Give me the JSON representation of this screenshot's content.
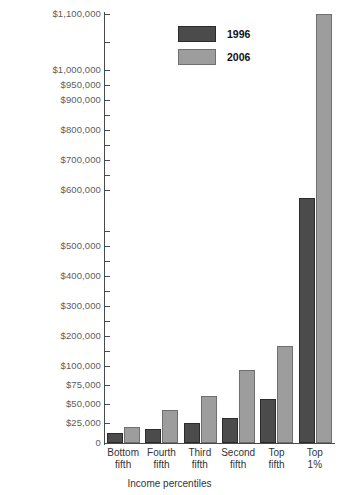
{
  "chart_data": {
    "type": "bar",
    "title": "",
    "xlabel": "Income percentiles",
    "ylabel": "",
    "categories": [
      "Bottom\nfifth",
      "Fourth\nfifth",
      "Third\nfifth",
      "Second\nfifth",
      "Top\nfifth",
      "Top\n1%"
    ],
    "series": [
      {
        "name": "1996",
        "color": "#4b4b4b",
        "values": [
          12000,
          18000,
          25000,
          32000,
          57000,
          590000
        ]
      },
      {
        "name": "2006",
        "color": "#9d9d9d",
        "values": [
          20000,
          42000,
          60000,
          95000,
          168000,
          1100000
        ]
      }
    ],
    "ylim": [
      0,
      1100000
    ],
    "y_scale_note": "broken axis: $25,000 steps below $100,000, $100,000 steps above",
    "y_ticks": [
      {
        "value": 0,
        "label": "0",
        "y": 443
      },
      {
        "value": 25000,
        "label": "$25,000",
        "y": 423
      },
      {
        "value": 50000,
        "label": "$50,000",
        "y": 404
      },
      {
        "value": 75000,
        "label": "$75,000",
        "y": 385
      },
      {
        "value": 100000,
        "label": "$100,000",
        "y": 366
      },
      {
        "value": 150000,
        "label": "",
        "y": 351
      },
      {
        "value": 200000,
        "label": "$200,000",
        "y": 336
      },
      {
        "value": 250000,
        "label": "",
        "y": 321
      },
      {
        "value": 300000,
        "label": "$300,000",
        "y": 306
      },
      {
        "value": 350000,
        "label": "",
        "y": 291
      },
      {
        "value": 400000,
        "label": "$400,000",
        "y": 276
      },
      {
        "value": 450000,
        "label": "",
        "y": 261
      },
      {
        "value": 500000,
        "label": "$500,000",
        "y": 246
      },
      {
        "value": 550000,
        "label": "",
        "y": 231
      },
      {
        "value": 600000,
        "label": "$600,000",
        "y": 190
      },
      {
        "value": 650000,
        "label": "",
        "y": 175
      },
      {
        "value": 700000,
        "label": "$700,000",
        "y": 160
      },
      {
        "value": 750000,
        "label": "",
        "y": 145
      },
      {
        "value": 800000,
        "label": "$800,000",
        "y": 130
      },
      {
        "value": 850000,
        "label": "",
        "y": 115
      },
      {
        "value": 900000,
        "label": "$900,000",
        "y": 100
      },
      {
        "value": 950000,
        "label": "$950,000",
        "y": 85
      },
      {
        "value": 1000000,
        "label": "$1,000,000",
        "y": 70
      },
      {
        "value": 1050000,
        "label": "",
        "y": 42
      },
      {
        "value": 1100000,
        "label": "$1,100,000",
        "y": 14
      }
    ],
    "grid": false,
    "legend_position": "top-center",
    "legend": [
      "1996",
      "2006"
    ]
  },
  "accent_colors": {
    "series_1996": "#4b4b4b",
    "series_2006": "#9d9d9d",
    "axis": "#4a4a4a",
    "tick_label": "#5d5d5d",
    "background": "#ffffff"
  }
}
